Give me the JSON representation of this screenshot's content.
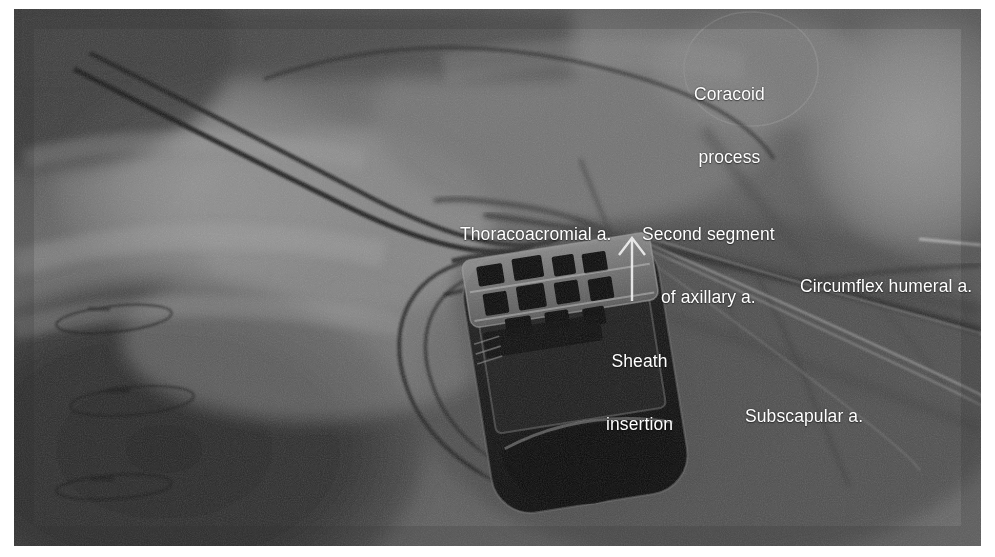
{
  "figure": {
    "kind": "fluoroscopy-image",
    "modality": "Fluoroscopic / angiographic still"
  },
  "palette": {
    "annotation_text": "#ffffff",
    "page_background": "#ffffff",
    "image_mid_gray": "#6b6b6b",
    "image_dark_gray": "#2a2a2a",
    "image_light_gray": "#a8a8a8",
    "device_body": "#161616",
    "lead_wire": "#1b1b1b",
    "vessel_contrast": "#2f2f2f",
    "guidewire_bright": "#c9c9c9"
  },
  "annotations": [
    {
      "id": "coracoid",
      "label": "Coracoid process",
      "lines": [
        "Coracoid",
        "process"
      ],
      "marker": "circle",
      "marker_shape": "ellipse-outline",
      "x": 680,
      "y": 33
    },
    {
      "id": "thoracoacromial",
      "label": "Thoracoacromial a.",
      "lines": [
        "Thoracoacromial a."
      ],
      "marker": "none",
      "x": 446,
      "y": 173
    },
    {
      "id": "second-segment-axillary",
      "label": "Second segment of axillary a.",
      "lines": [
        "Second segment",
        "of axillary a."
      ],
      "marker": "none",
      "x": 628,
      "y": 173
    },
    {
      "id": "circumflex-humeral",
      "label": "Circumflex humeral a.",
      "lines": [
        "Circumflex humeral a."
      ],
      "marker": "none",
      "x": 786,
      "y": 225
    },
    {
      "id": "sheath-insertion",
      "label": "Sheath insertion",
      "lines": [
        "Sheath",
        "insertion"
      ],
      "marker": "arrow-up",
      "arrow": {
        "tip_x": 632,
        "tip_y": 236,
        "tail_x": 632,
        "tail_y": 300
      },
      "x": 592,
      "y": 300
    },
    {
      "id": "subscapular",
      "label": "Subscapular a.",
      "lines": [
        "Subscapular a."
      ],
      "marker": "none",
      "x": 731,
      "y": 355
    }
  ],
  "image_features": {
    "device": {
      "name": "pulse generator",
      "description": "Radiopaque cardiac implantable device can with header connector block",
      "rotation_deg": -9
    },
    "leads": {
      "count": 2,
      "description": "Two pacing leads arcing from upper-left across the clavicle region into the header"
    },
    "sheath": {
      "description": "Introducer sheath and guidewire entering the second segment of the axillary artery"
    },
    "ecg_electrodes": {
      "count": 3,
      "description": "Surface ECG electrode pads overlying the lower-left dark soft tissue"
    }
  }
}
